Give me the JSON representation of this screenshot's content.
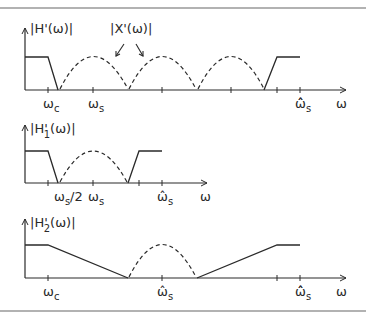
{
  "frame": {
    "stroke": "#555555"
  },
  "colors": {
    "ink": "#2a2a2a",
    "rule": "#666666"
  },
  "panels": [
    {
      "id": "H",
      "ylabel": {
        "main": "|H'(ω)|"
      },
      "callout": {
        "label": "|X'(ω)|"
      },
      "x_labels": [
        {
          "base": "ω",
          "sub": "c"
        },
        {
          "base": "ω",
          "sub": "s"
        },
        {
          "base": "ω̂̂",
          "sub": "s"
        },
        {
          "base": "ω",
          "sub": ""
        }
      ]
    },
    {
      "id": "H1",
      "ylabel": {
        "pre": "|H",
        "prime": "'",
        "sub": "1",
        "post": "(ω)|"
      },
      "x_labels": [
        {
          "base": "ω",
          "sub": "s",
          "post": "/2"
        },
        {
          "base": "ω",
          "sub": "s"
        },
        {
          "base": "ω̂",
          "sub": "s"
        },
        {
          "base": "ω",
          "sub": ""
        }
      ]
    },
    {
      "id": "H2",
      "ylabel": {
        "pre": "|H",
        "prime": "'",
        "sub": "2",
        "post": "(ω)|"
      },
      "x_labels": [
        {
          "base": "ω",
          "sub": "c"
        },
        {
          "base": "ω̂",
          "sub": "s"
        },
        {
          "base": "ω̂̂",
          "sub": "s"
        },
        {
          "base": "ω",
          "sub": ""
        }
      ]
    }
  ]
}
